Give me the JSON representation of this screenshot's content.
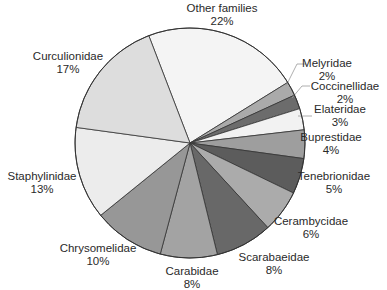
{
  "chart_data": {
    "type": "pie",
    "title": "",
    "start_angle_deg": -21,
    "direction": "clockwise",
    "center": [
      190,
      143
    ],
    "radius": 115,
    "slices": [
      {
        "label": "Other families",
        "value": 22,
        "pct": "22%",
        "color": "#f4f4f4",
        "lx": 222,
        "ly": 2
      },
      {
        "label": "Melyridae",
        "value": 2,
        "pct": "2%",
        "color": "#aaaaaa",
        "lx": 327,
        "ly": 57,
        "leader": [
          [
            286,
            86
          ],
          [
            297,
            64
          ],
          [
            306,
            64
          ]
        ]
      },
      {
        "label": "Coccinellidae",
        "value": 2,
        "pct": "2%",
        "color": "#6c6c6c",
        "lx": 345,
        "ly": 80,
        "leader": [
          [
            292,
            98
          ],
          [
            302,
            86
          ],
          [
            310,
            86
          ]
        ]
      },
      {
        "label": "Elateridae",
        "value": 3,
        "pct": "3%",
        "color": "#f2f2f2",
        "lx": 340,
        "ly": 103,
        "leader": [
          [
            298,
            116
          ],
          [
            312,
            116
          ]
        ]
      },
      {
        "label": "Buprestidae",
        "value": 4,
        "pct": "4%",
        "color": "#9e9e9e",
        "lx": 331,
        "ly": 131
      },
      {
        "label": "Tenebrionidae",
        "value": 5,
        "pct": "5%",
        "color": "#5c5c5c",
        "lx": 334,
        "ly": 170
      },
      {
        "label": "Cerambycidae",
        "value": 6,
        "pct": "6%",
        "color": "#ababab",
        "lx": 311,
        "ly": 215
      },
      {
        "label": "Scarabaeidae",
        "value": 8,
        "pct": "8%",
        "color": "#686868",
        "lx": 274,
        "ly": 251
      },
      {
        "label": "Carabidae",
        "value": 8,
        "pct": "8%",
        "color": "#a3a3a3",
        "lx": 192,
        "ly": 265
      },
      {
        "label": "Chrysomelidae",
        "value": 10,
        "pct": "10%",
        "color": "#979797",
        "lx": 98,
        "ly": 242
      },
      {
        "label": "Staphylinidae",
        "value": 13,
        "pct": "13%",
        "color": "#ececec",
        "lx": 42,
        "ly": 170
      },
      {
        "label": "Curculionidae",
        "value": 17,
        "pct": "17%",
        "color": "#dddddd",
        "lx": 68,
        "ly": 50
      }
    ],
    "legend": "none"
  }
}
